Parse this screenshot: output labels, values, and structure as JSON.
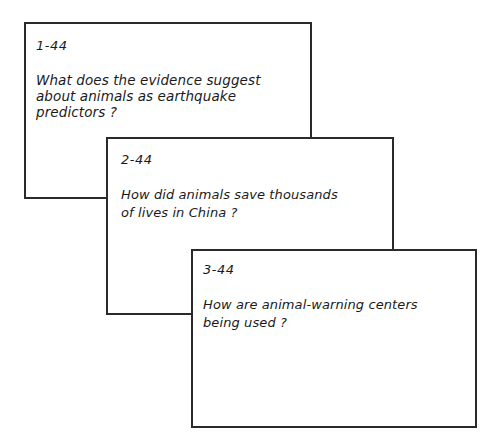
{
  "cards": [
    {
      "label": "1-44",
      "question_lines": [
        "What does the evidence suggest",
        "about animals as earthquake",
        "predictors ?"
      ]
    },
    {
      "label": "2-44",
      "question_lines": [
        "How did animals save thousands",
        "of lives in China ?"
      ]
    },
    {
      "label": "3-44",
      "question_lines": [
        "How are animal-warning centers",
        "being used ?"
      ]
    }
  ],
  "colors": {
    "card_border": "#2a2a2a",
    "ink": "#1a1a1a",
    "background": "#ffffff"
  }
}
